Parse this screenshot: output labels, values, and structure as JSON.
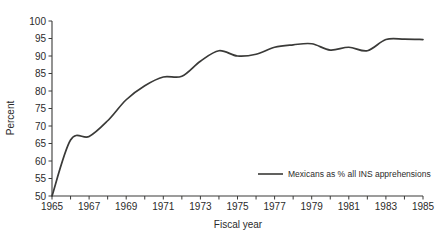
{
  "chart_data": {
    "type": "line",
    "title": "",
    "xlabel": "Fiscal year",
    "ylabel": "Percent",
    "xlim": [
      1965,
      1985
    ],
    "ylim": [
      50,
      100
    ],
    "grid": false,
    "legend_position": "inside-bottom-right",
    "y_ticks": [
      50,
      55,
      60,
      65,
      70,
      75,
      80,
      85,
      90,
      95,
      100
    ],
    "y_tick_labels": [
      "50",
      "55",
      "60",
      "65",
      "70",
      "75",
      "80",
      "85",
      "90",
      "95",
      "100"
    ],
    "x_ticks": [
      1965,
      1966,
      1967,
      1968,
      1969,
      1970,
      1971,
      1972,
      1973,
      1974,
      1975,
      1976,
      1977,
      1978,
      1979,
      1980,
      1981,
      1982,
      1983,
      1984,
      1985
    ],
    "x_tick_labels": [
      "1965",
      "",
      "1967",
      "",
      "1969",
      "",
      "1971",
      "",
      "1973",
      "",
      "1975",
      "",
      "1977",
      "",
      "1979",
      "",
      "1981",
      "",
      "1983",
      "",
      "1985"
    ],
    "x_labeled_ticks": [
      1965,
      1967,
      1969,
      1971,
      1973,
      1975,
      1977,
      1979,
      1981,
      1983,
      1985
    ],
    "series": [
      {
        "name": "Mexicans as % all INS apprehensions",
        "color": "#3a3a38",
        "x": [
          1965,
          1966,
          1967,
          1968,
          1969,
          1970,
          1971,
          1972,
          1973,
          1974,
          1975,
          1976,
          1977,
          1978,
          1979,
          1980,
          1981,
          1982,
          1983,
          1984,
          1985
        ],
        "values": [
          50.0,
          66.0,
          67.0,
          71.5,
          77.5,
          81.5,
          84.0,
          84.2,
          88.5,
          91.5,
          90.0,
          90.5,
          92.5,
          93.2,
          93.5,
          91.7,
          92.5,
          91.5,
          94.7,
          94.8,
          94.7
        ]
      }
    ],
    "legend": [
      {
        "label": "Mexicans as % all INS apprehensions",
        "color": "#3a3a38"
      }
    ]
  },
  "axes": {
    "y_title": "Percent",
    "x_title": "Fiscal year"
  }
}
